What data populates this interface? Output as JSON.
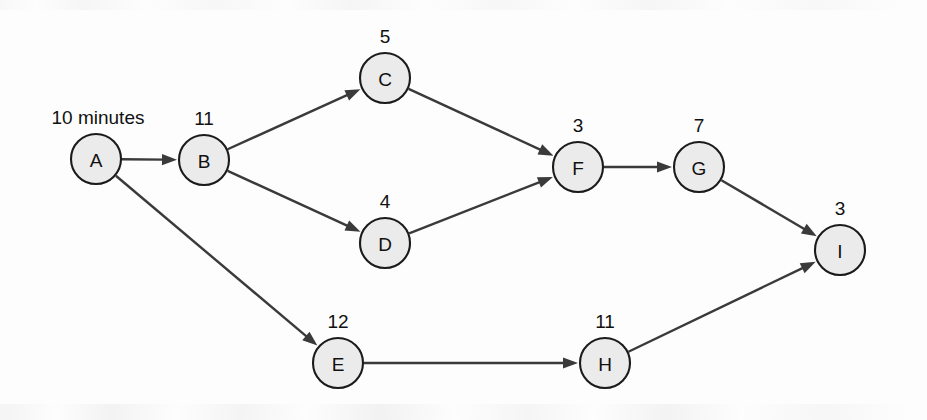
{
  "diagram": {
    "type": "activity-network-diagram",
    "background_color": "#fdfdfd",
    "node_fill_color": "#ebebeb",
    "node_stroke_color": "#1b1b1b",
    "edge_color": "#3a3a3a",
    "unit_annotation": "10 minutes",
    "nodes": [
      {
        "id": "A",
        "label": "A",
        "duration": "10 minutes",
        "duration_is_unit_label": true,
        "cx": 96,
        "cy": 159,
        "r": 25
      },
      {
        "id": "B",
        "label": "B",
        "duration": "11",
        "cx": 204,
        "cy": 160,
        "r": 25
      },
      {
        "id": "C",
        "label": "C",
        "duration": "5",
        "cx": 385,
        "cy": 78,
        "r": 25
      },
      {
        "id": "D",
        "label": "D",
        "duration": "4",
        "cx": 385,
        "cy": 243,
        "r": 25
      },
      {
        "id": "E",
        "label": "E",
        "duration": "12",
        "cx": 338,
        "cy": 363,
        "r": 25
      },
      {
        "id": "F",
        "label": "F",
        "duration": "3",
        "cx": 578,
        "cy": 167,
        "r": 25
      },
      {
        "id": "G",
        "label": "G",
        "duration": "7",
        "cx": 699,
        "cy": 167,
        "r": 25
      },
      {
        "id": "H",
        "label": "H",
        "duration": "11",
        "cx": 605,
        "cy": 363,
        "r": 25
      },
      {
        "id": "I",
        "label": "I",
        "duration": "3",
        "cx": 840,
        "cy": 250,
        "r": 25
      }
    ],
    "edges": [
      {
        "from": "A",
        "to": "B"
      },
      {
        "from": "A",
        "to": "E"
      },
      {
        "from": "B",
        "to": "C"
      },
      {
        "from": "B",
        "to": "D"
      },
      {
        "from": "C",
        "to": "F"
      },
      {
        "from": "D",
        "to": "F"
      },
      {
        "from": "F",
        "to": "G"
      },
      {
        "from": "G",
        "to": "I"
      },
      {
        "from": "E",
        "to": "H"
      },
      {
        "from": "H",
        "to": "I"
      }
    ]
  }
}
